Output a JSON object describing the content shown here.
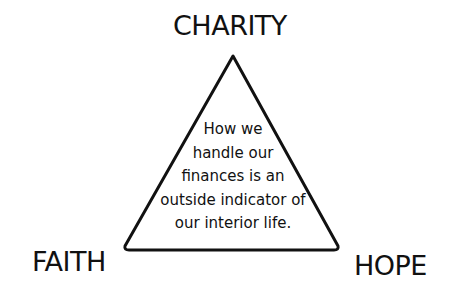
{
  "diagram": {
    "type": "triangle",
    "vertices": {
      "top": "CHARITY",
      "bottom_left": "FAITH",
      "bottom_right": "HOPE"
    },
    "center_text_lines": [
      "How we",
      "handle our",
      "finances is an",
      "outside indicator of",
      "our interior life."
    ],
    "colors": {
      "stroke": "#111111",
      "background": "#ffffff"
    }
  }
}
